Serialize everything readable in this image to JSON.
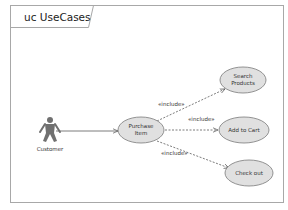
{
  "diagram": {
    "title": "uc UseCases",
    "type": "UML Use Case Diagram",
    "colors": {
      "frame": "#a8a8a8",
      "use_case_fill": "#e0e0e0",
      "use_case_stroke": "#7a7a7a",
      "actor": "#707070",
      "edge": "#5a5a5a",
      "text": "#333333"
    },
    "actor": {
      "id": "customer",
      "label": "Customer"
    },
    "use_cases": [
      {
        "id": "purchase",
        "line1": "Purchase",
        "line2": "Item"
      },
      {
        "id": "search",
        "line1": "Search",
        "line2": "Products"
      },
      {
        "id": "cart",
        "line1": "Add to Cart",
        "line2": ""
      },
      {
        "id": "checkout",
        "line1": "Check out",
        "line2": ""
      }
    ],
    "relationships": [
      {
        "from": "customer",
        "to": "purchase",
        "type": "association",
        "label": ""
      },
      {
        "from": "purchase",
        "to": "search",
        "type": "include",
        "label": "«include»"
      },
      {
        "from": "purchase",
        "to": "cart",
        "type": "include",
        "label": "«include»"
      },
      {
        "from": "purchase",
        "to": "checkout",
        "type": "include",
        "label": "«include»"
      }
    ]
  }
}
